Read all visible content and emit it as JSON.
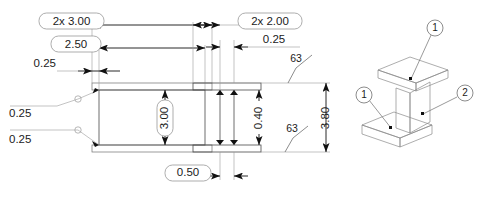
{
  "drawing": {
    "title": "I-beam part detail drawing",
    "line_color": "#1b1b1b",
    "thin_line_color": "#9a9a9a",
    "views": [
      {
        "name": "front-view",
        "label": ""
      },
      {
        "name": "side-view",
        "label": ""
      },
      {
        "name": "isometric-view",
        "label": ""
      }
    ],
    "dimensions": {
      "front_width_2x": "2x 3.00",
      "front_width_mid": "2.50",
      "front_flange_step": "0.25",
      "front_height": "3.00",
      "fillet_upper": "0.25",
      "fillet_lower": "0.25",
      "web_thickness_bottom": "0.50",
      "side_width_2x": "2x 2.00",
      "side_offset": "0.25",
      "side_flange_thickness": "0.40",
      "side_total_height": "3.80"
    },
    "surface_finish": [
      {
        "name": "finish-upper",
        "value": "63"
      },
      {
        "name": "finish-lower",
        "value": "63"
      }
    ],
    "balloons": [
      {
        "name": "balloon-top-flange",
        "value": "1"
      },
      {
        "name": "balloon-bottom-flange",
        "value": "1"
      },
      {
        "name": "balloon-web",
        "value": "2"
      }
    ]
  }
}
